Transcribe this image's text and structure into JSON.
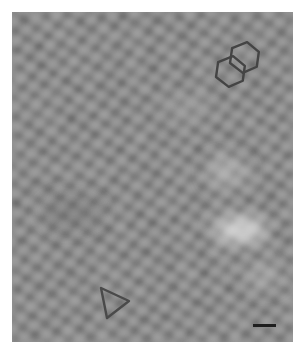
{
  "image": {
    "description": "Grayscale scanning probe micrograph of a hexagonal lattice",
    "colors": {
      "background": "#ffffff",
      "base": "#8a8a8a",
      "dark": "#5e5e5e",
      "light": "#b4b4b4",
      "marker": "#444444"
    }
  },
  "annotations": {
    "hexagon_pair": {
      "shape": "two fused hexagons",
      "icon": "fused-hexagons-icon"
    },
    "triangle": {
      "shape": "triangle outline",
      "icon": "triangle-icon"
    },
    "scale_bar": {
      "icon": "scale-bar",
      "label": ""
    }
  }
}
